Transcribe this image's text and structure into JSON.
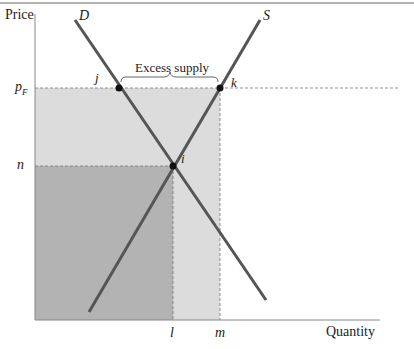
{
  "diagram": {
    "type": "supply-demand",
    "axes": {
      "y_label": "Price",
      "x_label": "Quantity"
    },
    "curves": {
      "demand": {
        "label": "D",
        "color": "#555555"
      },
      "supply": {
        "label": "S",
        "color": "#555555"
      }
    },
    "price_levels": {
      "floor": {
        "label_main": "p",
        "label_sub": "F"
      },
      "equilibrium": {
        "label": "n"
      }
    },
    "quantity_levels": {
      "equilibrium": {
        "label": "l"
      },
      "supplied_at_floor": {
        "label": "m"
      }
    },
    "points": [
      {
        "id": "j",
        "label": "j"
      },
      {
        "id": "k",
        "label": "k"
      },
      {
        "id": "i",
        "label": "i"
      }
    ],
    "annotation": {
      "label": "Excess supply"
    },
    "colors": {
      "dark_region": "#b3b3b3",
      "light_region": "#dcdcdc",
      "axis": "#888888",
      "dashed": "#777777",
      "point": "#111111"
    }
  }
}
